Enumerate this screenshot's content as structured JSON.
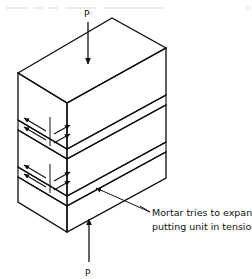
{
  "figure": {
    "background_color": "#ffffff",
    "line_color": "#111111",
    "top_load": {
      "label": "P",
      "icon": "arrow-down-icon",
      "direction": "down"
    },
    "bottom_load": {
      "label": "P",
      "icon": "arrow-up-icon",
      "direction": "up"
    },
    "annotation": {
      "line1": "Mortar tries to expand,",
      "line2": "putting unit in tension",
      "leader_icon": "leader-line-arrow-icon"
    },
    "units": [
      {
        "name": "top-masonry-unit"
      },
      {
        "name": "middle-masonry-unit"
      },
      {
        "name": "bottom-masonry-unit"
      }
    ],
    "mortar_joints": [
      {
        "name": "upper-mortar-joint"
      },
      {
        "name": "lower-mortar-joint"
      }
    ],
    "expansion_arrows": [
      {
        "name": "upper-joint-expansion-arrows",
        "direction": "outward",
        "count": 4
      },
      {
        "name": "lower-joint-expansion-arrows",
        "direction": "outward",
        "count": 4
      }
    ]
  }
}
